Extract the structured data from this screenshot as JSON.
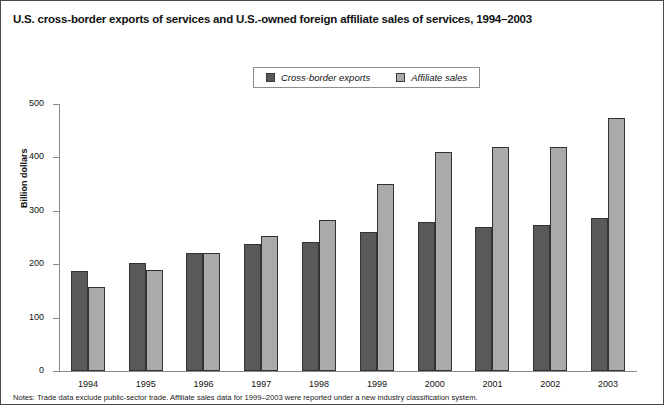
{
  "chart_data": {
    "type": "bar",
    "title": "U.S. cross-border exports of services and U.S.-owned foreign affiliate sales of services, 1994–2003",
    "xlabel": "",
    "ylabel": "Billion dollars",
    "ylim": [
      0,
      500
    ],
    "yticks": [
      0,
      100,
      200,
      300,
      400,
      500
    ],
    "grid": false,
    "legend_position": "top-center",
    "categories": [
      "1994",
      "1995",
      "1996",
      "1997",
      "1998",
      "1999",
      "2000",
      "2001",
      "2002",
      "2003"
    ],
    "series": [
      {
        "name": "Cross-border exports",
        "color": "#595959",
        "values": [
          188,
          203,
          221,
          237,
          241,
          261,
          279,
          269,
          273,
          287
        ]
      },
      {
        "name": "Affiliate sales",
        "color": "#aaaaaa",
        "values": [
          158,
          189,
          221,
          252,
          283,
          350,
          411,
          420,
          419,
          473
        ]
      }
    ],
    "notes": "Notes: Trade data exclude public-sector trade. Affiliate sales data for 1999–2003 were reported under a new industry classification system."
  }
}
